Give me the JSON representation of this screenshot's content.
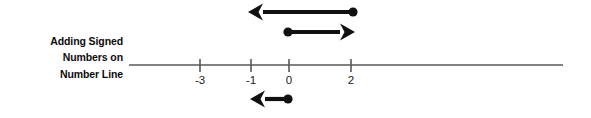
{
  "figure": {
    "caption_lines": [
      "Adding Signed",
      "Numbers on",
      "Number Line"
    ],
    "background_color": "#ffffff",
    "line_color": "#595959",
    "ink_color": "#111111",
    "text_color": "#0d0d0d"
  },
  "number_line": {
    "axis_start_x": 129,
    "axis_end_x": 563,
    "axis_y": 65,
    "ticks": [
      {
        "label": "-3",
        "x": 200
      },
      {
        "label": "-1",
        "x": 251
      },
      {
        "label": "0",
        "x": 289
      },
      {
        "label": "2",
        "x": 351
      }
    ]
  },
  "arrows": [
    {
      "name": "arrow-top-negative-three",
      "from_label": "2",
      "to_label": "-1",
      "direction": "left",
      "dot_x": 353,
      "tip_x": 248,
      "y": 12
    },
    {
      "name": "arrow-middle-positive-two",
      "from_label": "0",
      "to_label": "2",
      "direction": "right",
      "dot_x": 288,
      "tip_x": 355,
      "y": 32
    },
    {
      "name": "arrow-bottom-negative-one",
      "from_label": "0",
      "to_label": "-1",
      "direction": "left",
      "dot_x": 288,
      "tip_x": 250,
      "y": 99
    }
  ]
}
